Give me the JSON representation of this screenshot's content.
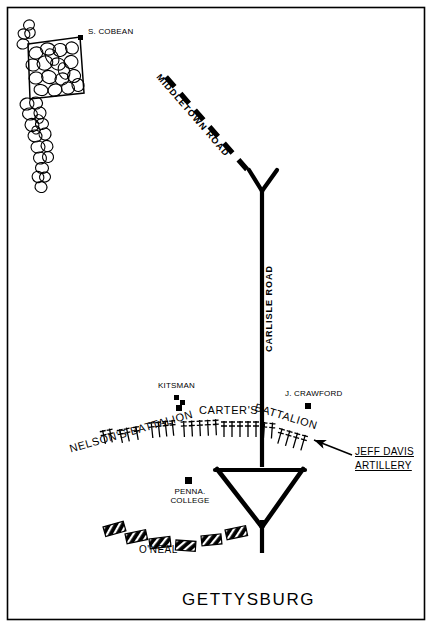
{
  "map": {
    "title": "GETTYSBURG",
    "frame_color": "#000000",
    "background_color": "#ffffff",
    "ink_color": "#000000"
  },
  "roads": [
    {
      "name": "MIDDLETOWN ROAD",
      "style": "dashed",
      "label_rotation_deg": 52
    },
    {
      "name": "CARLISLE ROAD",
      "style": "solid",
      "label_rotation_deg": -90
    }
  ],
  "places": [
    {
      "name": "S. COBEAN",
      "marker": "building-square"
    },
    {
      "name": "KITSMAN",
      "marker": "building-square"
    },
    {
      "name": "J. CRAWFORD",
      "marker": "building-square"
    },
    {
      "name": "PENNA.",
      "name2": "COLLEGE",
      "marker": "building-square"
    }
  ],
  "units": [
    {
      "name": "NELSON'S BATTALION",
      "type": "artillery",
      "rotation_deg": -16
    },
    {
      "name": "CARTER'S",
      "type": "artillery",
      "rotation_deg": 0
    },
    {
      "name": "BATTALION",
      "type": "artillery",
      "rotation_deg": 17
    },
    {
      "name": "O'NEAL",
      "type": "infantry",
      "rotation_deg": 0
    }
  ],
  "callout": {
    "line1": "JEFF DAVIS",
    "line2": "ARTILLERY",
    "points_to": "artillery-gun-line-right"
  },
  "terrain": [
    {
      "name": "woods-orchard-block",
      "type": "woods"
    },
    {
      "name": "tree-line",
      "type": "woods"
    },
    {
      "name": "orchard-field-rectangle",
      "type": "field-outline"
    }
  ]
}
